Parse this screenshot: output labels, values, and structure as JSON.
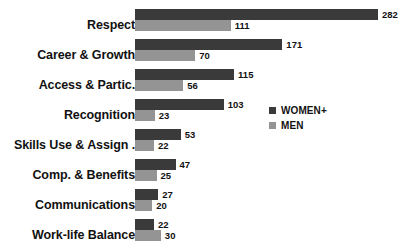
{
  "chart_data": {
    "type": "bar",
    "orientation": "horizontal",
    "title": "",
    "subtitle": "",
    "xlabel": "",
    "ylabel": "",
    "grid": false,
    "xlim": [
      0,
      282
    ],
    "legend_position": "middle-right",
    "categories": [
      "Respect",
      "Career & Growth",
      "Access & Partic.",
      "Recognition",
      "Skills Use & Assign .",
      "Comp. & Benefits",
      "Communications",
      "Work-life Balance"
    ],
    "series": [
      {
        "name": "WOMEN+",
        "color": "#3a3a3a",
        "values": [
          282,
          171,
          115,
          103,
          53,
          47,
          27,
          22
        ]
      },
      {
        "name": "MEN",
        "color": "#949494",
        "values": [
          111,
          70,
          56,
          23,
          22,
          25,
          20,
          30
        ]
      }
    ]
  },
  "legend": {
    "items": [
      {
        "label": "WOMEN+",
        "color": "#3a3a3a"
      },
      {
        "label": "MEN",
        "color": "#949494"
      }
    ]
  }
}
